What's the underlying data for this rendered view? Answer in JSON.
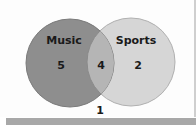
{
  "diagram": {
    "type": "venn",
    "sets": [
      {
        "label": "Music",
        "only_count": "5",
        "color": "#8e8e8e"
      },
      {
        "label": "Sports",
        "only_count": "2",
        "color": "#d6d6d6"
      }
    ],
    "intersection": {
      "count": "4",
      "color": "#b5b5b5"
    },
    "outside": {
      "count": "1"
    }
  }
}
